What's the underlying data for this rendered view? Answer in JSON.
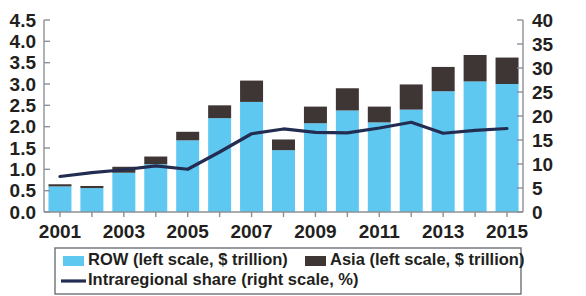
{
  "chart_data": {
    "type": "bar",
    "subtype": "stacked-bar-with-line",
    "title": "",
    "xlabel": "",
    "ylabel": "",
    "categories": [
      "2001",
      "2002",
      "2003",
      "2004",
      "2005",
      "2006",
      "2007",
      "2008",
      "2009",
      "2010",
      "2011",
      "2012",
      "2013",
      "2014",
      "2015"
    ],
    "tick_categories": [
      "2001",
      "2003",
      "2005",
      "2007",
      "2009",
      "2011",
      "2013",
      "2015"
    ],
    "grid": false,
    "legend_position": "bottom",
    "left_axis": {
      "label": "$ trillion",
      "ylim": [
        0.0,
        4.5
      ],
      "ticks": [
        "0.0",
        "0.5",
        "1.0",
        "1.5",
        "2.0",
        "2.5",
        "3.0",
        "3.5",
        "4.0",
        "4.5"
      ],
      "tick_values": [
        0.0,
        0.5,
        1.0,
        1.5,
        2.0,
        2.5,
        3.0,
        3.5,
        4.0,
        4.5
      ]
    },
    "right_axis": {
      "label": "%",
      "ylim": [
        0,
        40
      ],
      "ticks": [
        "0",
        "5",
        "10",
        "15",
        "20",
        "25",
        "30",
        "35",
        "40"
      ],
      "tick_values": [
        0,
        5,
        10,
        15,
        20,
        25,
        30,
        35,
        40
      ]
    },
    "series": [
      {
        "name": "ROW (left scale, $ trillion)",
        "key": "row",
        "type": "bar",
        "stack": "total",
        "axis": "left",
        "color": "#5ec8f0",
        "values": [
          0.6,
          0.56,
          0.92,
          1.12,
          1.68,
          2.2,
          2.58,
          1.45,
          2.08,
          2.38,
          2.1,
          2.4,
          2.83,
          3.06,
          3.0
        ]
      },
      {
        "name": "Asia (left scale, $ trillion)",
        "key": "asia",
        "type": "bar",
        "stack": "total",
        "axis": "left",
        "color": "#3d3634",
        "values": [
          0.05,
          0.05,
          0.14,
          0.18,
          0.2,
          0.3,
          0.5,
          0.25,
          0.39,
          0.52,
          0.37,
          0.59,
          0.57,
          0.62,
          0.62
        ]
      },
      {
        "name": "Intraregional share  (right scale, %)",
        "key": "intraregional_share",
        "type": "line",
        "axis": "right",
        "color": "#232d52",
        "values": [
          7.4,
          8.2,
          8.8,
          9.6,
          8.9,
          12.5,
          16.3,
          17.3,
          16.6,
          16.5,
          17.5,
          18.7,
          16.4,
          17.0,
          17.4
        ]
      }
    ]
  },
  "legend": {
    "items": [
      {
        "label": "ROW (left scale, $ trillion)",
        "marker": "swatch",
        "color": "#5ec8f0"
      },
      {
        "label": "Asia (left scale, $ trillion)",
        "marker": "swatch",
        "color": "#3d3634"
      },
      {
        "label": "Intraregional share  (right scale, %)",
        "marker": "line",
        "color": "#232d52"
      }
    ]
  },
  "colors": {
    "row": "#5ec8f0",
    "asia": "#3d3634",
    "line": "#232d52",
    "axis": "#8c9096",
    "text": "#231f20",
    "legend_border": "#6b6f76"
  }
}
